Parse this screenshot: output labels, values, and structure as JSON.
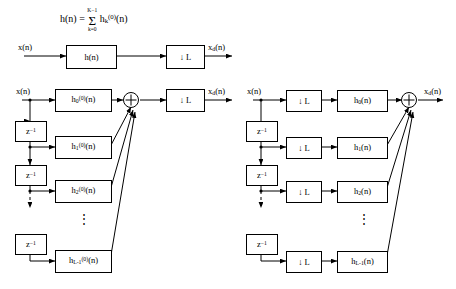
{
  "figure": {
    "equation": {
      "lhs": "h(n) =",
      "sum_top": "K−1",
      "sum_sign": "Σ",
      "sum_bottom": "k=0",
      "rhs_base": "h",
      "rhs_sub": "k",
      "rhs_sup": "(0)",
      "rhs_arg": "(n)"
    },
    "top_diagram": {
      "input_label": "x(n)",
      "output_label": "x",
      "output_sub": "d",
      "output_arg": "(n)",
      "filter_box": "h(n)",
      "downsampler_box": "↓ L"
    },
    "left_diagram": {
      "input_label": "x(n)",
      "output_label": "x",
      "output_sub": "d",
      "output_arg": "(n)",
      "delay_label": "z",
      "delay_sup": "−1",
      "adder_symbol": "⊕",
      "downsampler_box": "↓ L",
      "vertical_dots": "⋮",
      "filters": [
        {
          "base": "h",
          "sub": "0",
          "sup": "(0)",
          "arg": "(n)"
        },
        {
          "base": "h",
          "sub": "1",
          "sup": "(0)",
          "arg": "(n)"
        },
        {
          "base": "h",
          "sub": "2",
          "sup": "(0)",
          "arg": "(n)"
        },
        {
          "base": "h",
          "sub": "L-1",
          "sup": "(0)",
          "arg": "(n)"
        }
      ]
    },
    "right_diagram": {
      "input_label": "x(n)",
      "output_label": "x",
      "output_sub": "d",
      "output_arg": "(n)",
      "delay_label": "z",
      "delay_sup": "−1",
      "adder_symbol": "⊕",
      "downsampler_box": "↓ L",
      "vertical_dots": "⋮",
      "filters": [
        {
          "base": "h",
          "sub": "0",
          "arg": "(n)"
        },
        {
          "base": "h",
          "sub": "1",
          "arg": "(n)"
        },
        {
          "base": "h",
          "sub": "2",
          "arg": "(n)"
        },
        {
          "base": "h",
          "sub": "L-1",
          "arg": "(n)"
        }
      ]
    }
  }
}
